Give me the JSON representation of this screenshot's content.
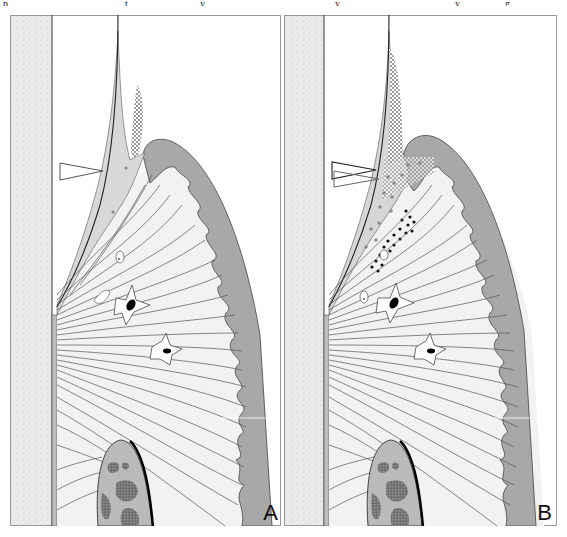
{
  "figure": {
    "top_cut_text_glyphs": [
      "p",
      "t",
      "y",
      "y",
      "y",
      "g"
    ],
    "panels": [
      {
        "id": "A",
        "label": "A",
        "markers": {
          "arrowhead_outline_count": 1
        },
        "inflammation": {
          "plaque_hatched": "small",
          "inflammatory_dots": false
        }
      },
      {
        "id": "B",
        "label": "B",
        "markers": {
          "arrowhead_outline_count": 2
        },
        "inflammation": {
          "plaque_hatched": "large",
          "inflammatory_dots": true
        }
      }
    ],
    "colors": {
      "enamel_stipple": "#e4e4e4",
      "gingiva_dark": "#a6a6a6",
      "connective_tissue": "#f1f1f1",
      "junctional_epithelium": "#d6d6d6",
      "bone": "#b9b9b9",
      "bone_marrow": "#7d7d7d",
      "outline": "#333333",
      "fiber": "#555555"
    }
  }
}
